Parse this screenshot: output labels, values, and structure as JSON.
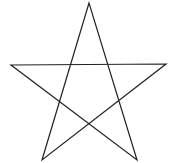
{
  "diagram": {
    "shape": "pentagram",
    "stroke_color": "#222222",
    "background": "#ffffff",
    "points": {
      "top": [
        89,
        3
      ],
      "left": [
        11,
        65
      ],
      "right": [
        166,
        64
      ],
      "bottom_left": [
        42,
        160
      ],
      "bottom_right": [
        137,
        160
      ]
    }
  }
}
